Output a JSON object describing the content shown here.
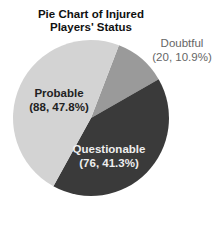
{
  "chart_data": {
    "type": "pie",
    "title": "Pie Chart of Injured Players' Status",
    "title_lines": [
      "Pie Chart of Injured",
      "Players' Status"
    ],
    "categories": [
      "Doubtful",
      "Questionable",
      "Probable"
    ],
    "values": [
      20,
      76,
      88
    ],
    "percentages": [
      10.9,
      41.3,
      47.8
    ],
    "labels": [
      "Doubtful (20, 10.9%)",
      "Questionable (76, 41.3%)",
      "Probable (88, 47.8%)"
    ],
    "colors": [
      "#9a9a9a",
      "#3a3a3a",
      "#d3d3d3"
    ],
    "start_angle_deg": 21,
    "direction": "clockwise",
    "legend": "none"
  },
  "labels": {
    "probable": {
      "name": "Probable",
      "detail": "(88, 47.8%)"
    },
    "questionable": {
      "name": "Questionable",
      "detail": "(76, 41.3%)"
    },
    "doubtful": {
      "name": "Doubtful",
      "detail": "(20, 10.9%)"
    }
  }
}
